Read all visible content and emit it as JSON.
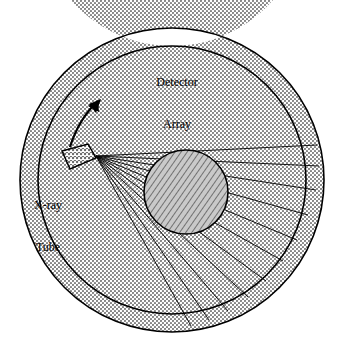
{
  "figure": {
    "type": "ct-scanner-geometry-diagram",
    "background_color": "#ffffff",
    "labels": {
      "detector_array_line1": "Detector",
      "detector_array_line2": "Array",
      "xray_tube_line1": "X-ray",
      "xray_tube_line2": "Tube"
    },
    "colors": {
      "outline": "#000000",
      "gantry_ring_fill": "#a8a8a8",
      "tube_fill": "#9a9a9a",
      "phantom_fill": "#8f8f8f",
      "beam_line": "#000000"
    },
    "geometry": {
      "gantry_outer_radius": 152,
      "gantry_inner_radius": 134,
      "gantry_center_x": 172,
      "gantry_center_y": 180,
      "phantom_center_x": 186,
      "phantom_center_y": 192,
      "phantom_radius": 42,
      "tube_x": 60,
      "tube_y": 162,
      "tube_width": 30,
      "tube_height": 22,
      "focal_spot_x": 92,
      "focal_spot_y": 155,
      "fan_beam_ray_count": 11,
      "rotation_arrow": "counter-clockwise"
    }
  }
}
